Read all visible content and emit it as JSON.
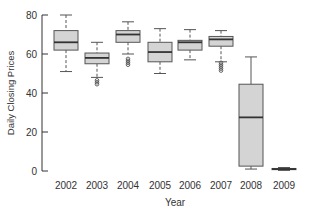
{
  "chart_data": {
    "type": "box",
    "title": "",
    "xlabel": "Year",
    "ylabel": "Daily Closing Prices",
    "ylim": [
      0,
      80
    ],
    "yticks": [
      0,
      20,
      40,
      60,
      80
    ],
    "grid": false,
    "categories": [
      "2002",
      "2003",
      "2004",
      "2005",
      "2006",
      "2007",
      "2008",
      "2009"
    ],
    "boxes": [
      {
        "label": "2002",
        "whisker_low": 51,
        "q1": 62,
        "median": 66,
        "q3": 72,
        "whisker_high": 80,
        "outliers": []
      },
      {
        "label": "2003",
        "whisker_low": 48,
        "q1": 55,
        "median": 58,
        "q3": 60.5,
        "whisker_high": 66,
        "outliers": [
          44.5,
          45.5,
          46.5
        ]
      },
      {
        "label": "2004",
        "whisker_low": 60,
        "q1": 66,
        "median": 70,
        "q3": 72,
        "whisker_high": 76.5,
        "outliers": [
          54.5,
          55.5,
          56.5,
          57.5
        ]
      },
      {
        "label": "2005",
        "whisker_low": 50,
        "q1": 56,
        "median": 61,
        "q3": 66,
        "whisker_high": 73,
        "outliers": []
      },
      {
        "label": "2006",
        "whisker_low": 57,
        "q1": 62,
        "median": 66,
        "q3": 67,
        "whisker_high": 72.5,
        "outliers": []
      },
      {
        "label": "2007",
        "whisker_low": 56,
        "q1": 64,
        "median": 67.5,
        "q3": 69,
        "whisker_high": 72,
        "outliers": [
          51.5,
          52.5,
          53.5,
          54.5,
          55.5
        ]
      },
      {
        "label": "2008",
        "whisker_low": 1,
        "q1": 2.5,
        "median": 27.5,
        "q3": 44.5,
        "whisker_high": 58.5,
        "outliers": []
      },
      {
        "label": "2009",
        "whisker_low": 0.3,
        "q1": 0.7,
        "median": 1,
        "q3": 1.3,
        "whisker_high": 1.8,
        "outliers": []
      }
    ]
  },
  "style": {
    "box_fill": "#d4d4d4",
    "box_stroke": "#555555",
    "median_color": "#333333",
    "axis_color": "#333333"
  }
}
